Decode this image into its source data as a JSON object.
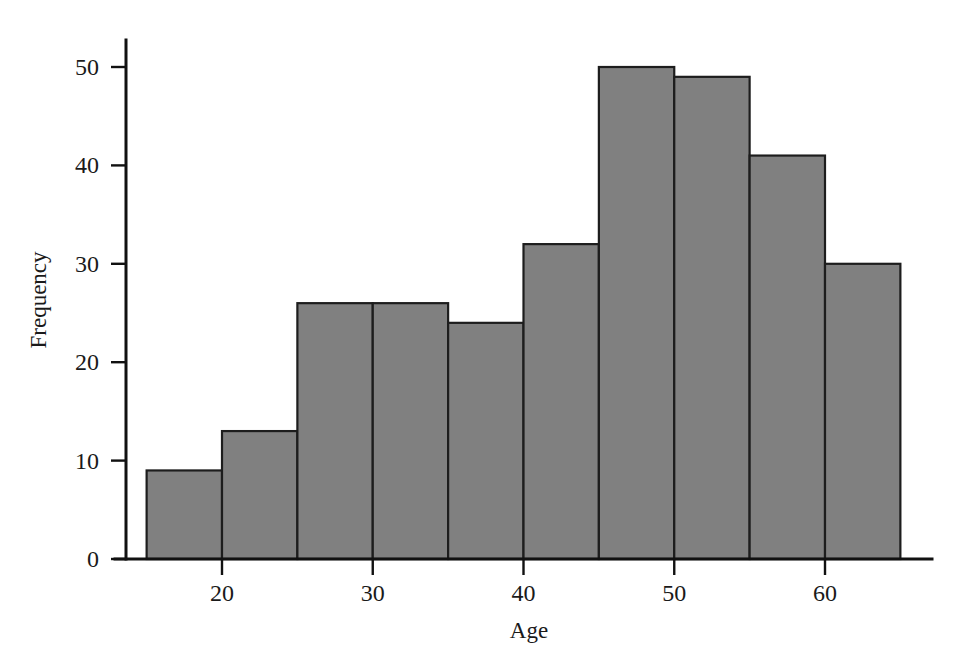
{
  "figure": {
    "background_color": "#ffffff",
    "bar_fill_color": "#808080",
    "bar_edge_color": "#1d1d1d",
    "axis_color": "#111111"
  },
  "axes": {
    "x_title": "Age",
    "y_title": "Frequency",
    "x_tick_labels": [
      "20",
      "30",
      "40",
      "50",
      "60"
    ],
    "y_tick_labels": [
      "0",
      "10",
      "20",
      "30",
      "40",
      "50"
    ]
  },
  "chart_data": {
    "type": "bar",
    "title": "",
    "xlabel": "Age",
    "ylabel": "Frequency",
    "xlim": [
      13,
      67
    ],
    "ylim": [
      0,
      53
    ],
    "grid": false,
    "legend": "none",
    "bin_width": 5,
    "bin_edges": [
      15,
      20,
      25,
      30,
      35,
      40,
      45,
      50,
      55,
      60,
      65
    ],
    "categories": [
      "15-20",
      "20-25",
      "25-30",
      "30-35",
      "35-40",
      "40-45",
      "45-50",
      "50-55",
      "55-60",
      "60-65"
    ],
    "values": [
      9,
      13,
      26,
      26,
      24,
      32,
      50,
      49,
      41,
      30
    ],
    "xticks": [
      20,
      30,
      40,
      50,
      60
    ],
    "yticks": [
      0,
      10,
      20,
      30,
      40,
      50
    ]
  }
}
